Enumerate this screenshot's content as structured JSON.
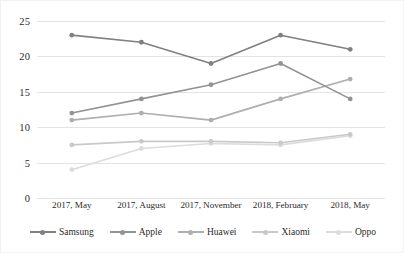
{
  "chart_data": {
    "type": "line",
    "title": "",
    "subtitle": "",
    "xlabel": "",
    "ylabel": "",
    "categories": [
      "2017, May",
      "2017, August",
      "2017, November",
      "2018, February",
      "2018, May"
    ],
    "series": [
      {
        "name": "Samsung",
        "color": "#808080",
        "values": [
          23,
          22,
          19,
          23,
          21
        ]
      },
      {
        "name": "Apple",
        "color": "#939393",
        "values": [
          12,
          14,
          16,
          19,
          14
        ]
      },
      {
        "name": "Huawei",
        "color": "#aeaeae",
        "values": [
          11,
          12,
          11,
          14,
          16.8
        ]
      },
      {
        "name": "Xiaomi",
        "color": "#c9c9c9",
        "values": [
          7.5,
          8,
          8,
          7.8,
          9
        ]
      },
      {
        "name": "Oppo",
        "color": "#dcdcdc",
        "values": [
          4,
          7,
          7.7,
          7.5,
          8.8
        ]
      }
    ],
    "ylim": [
      0,
      25
    ],
    "yticks": [
      0,
      5,
      10,
      15,
      20,
      25
    ],
    "ytick_labels": [
      "0",
      "5",
      "10",
      "15",
      "20",
      "25"
    ],
    "grid": true,
    "grid_axis": "y",
    "grid_color": "#e3e3e3",
    "legend_position": "bottom",
    "markers": true,
    "background": "#ffffff",
    "border_color": "#f2f2f2"
  }
}
